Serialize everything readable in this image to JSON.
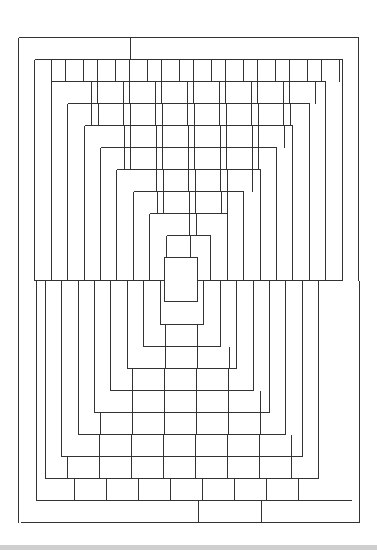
{
  "drawing": {
    "title": "",
    "stroke_color": "#333333",
    "background": "#ffffff",
    "bottom_bar_color": "#cfcfcf",
    "row_height": 22,
    "brick_width": 32,
    "ring_step": 16.4,
    "midline_y": 280,
    "top_half": {
      "outer": {
        "left": 18,
        "right": 358,
        "top": 37
      },
      "first_row_divider_x": 130,
      "rings": 11
    },
    "bottom_half": {
      "outer": {
        "left": 20,
        "right": 359,
        "bottom": 522
      },
      "last_row_dividers_x": [
        198,
        261
      ],
      "rings": 11
    },
    "center_rect": {
      "x": 164,
      "y": 257,
      "w": 33,
      "h": 44
    }
  }
}
